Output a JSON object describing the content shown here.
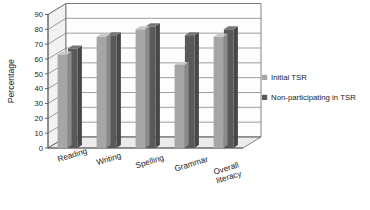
{
  "chart_data": {
    "type": "bar",
    "title": "",
    "xlabel": "",
    "ylabel": "Percentage",
    "ylim": [
      0,
      90
    ],
    "ytick_step": 10,
    "yticks": [
      "0",
      "10",
      "20",
      "30",
      "40",
      "50",
      "60",
      "70",
      "80",
      "90"
    ],
    "grid": true,
    "legend_position": "right",
    "categories": [
      "Reading",
      "Writing",
      "Spelling",
      "Grammar",
      "Overall literacy"
    ],
    "series": [
      {
        "name": "Initial TSR",
        "color": "#a6a6a6",
        "values": [
          63,
          75,
          80,
          56,
          75
        ]
      },
      {
        "name": "Non-participating in TSR",
        "color": "#595959",
        "values": [
          67,
          76,
          82,
          76,
          80
        ]
      }
    ]
  },
  "axis": {
    "y_title": "Percentage"
  },
  "legend": {
    "entries": [
      {
        "label": "Initial TSR",
        "swatch": "#a6a6a6"
      },
      {
        "label": "Non-participating in TSR",
        "swatch": "#595959"
      }
    ]
  },
  "colors": {
    "series_a": "#a6a6a6",
    "series_b": "#595959",
    "plot_background": "#fdfdfd",
    "floor": "#ebebeb",
    "wall": "#f2f2f2",
    "axis": "#555555"
  }
}
